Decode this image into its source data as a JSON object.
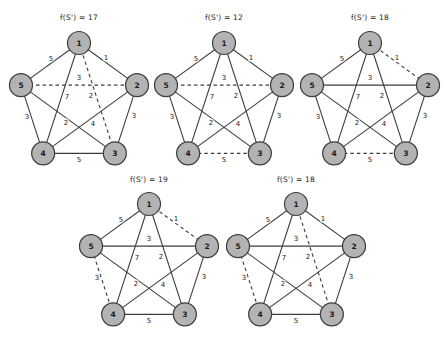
{
  "figure": {
    "node_labels": [
      "1",
      "2",
      "3",
      "4",
      "5"
    ],
    "edges": [
      {
        "from": "1",
        "to": "2",
        "weight": "1",
        "lx": 27,
        "ly": -44
      },
      {
        "from": "2",
        "to": "3",
        "weight": "3",
        "lx": 55,
        "ly": 14
      },
      {
        "from": "3",
        "to": "4",
        "weight": "5",
        "lx": 0,
        "ly": 58
      },
      {
        "from": "4",
        "to": "5",
        "weight": "3",
        "lx": -52,
        "ly": 15
      },
      {
        "from": "5",
        "to": "1",
        "weight": "5",
        "lx": -28,
        "ly": -43
      },
      {
        "from": "1",
        "to": "3",
        "weight": "2",
        "lx": 12,
        "ly": -6
      },
      {
        "from": "1",
        "to": "4",
        "weight": "7",
        "lx": -12,
        "ly": -5
      },
      {
        "from": "2",
        "to": "4",
        "weight": "4",
        "lx": 14,
        "ly": 22
      },
      {
        "from": "2",
        "to": "5",
        "weight": "3",
        "lx": 0,
        "ly": -24
      },
      {
        "from": "3",
        "to": "5",
        "weight": "2",
        "lx": -13,
        "ly": 21
      }
    ],
    "graphs": [
      {
        "title": "f(S') = 17",
        "cx": 79,
        "cy": 104,
        "dashed": [
          "2-5",
          "1-3"
        ]
      },
      {
        "title": "f(S') = 12",
        "cx": 224,
        "cy": 104,
        "dashed": [
          "2-5",
          "3-4"
        ]
      },
      {
        "title": "f(S') = 18",
        "cx": 370,
        "cy": 104,
        "dashed": [
          "1-2",
          "3-4"
        ]
      },
      {
        "title": "f(S') = 19",
        "cx": 149,
        "cy": 265,
        "dashed": [
          "1-2",
          "4-5"
        ]
      },
      {
        "title": "f(S') = 18",
        "cx": 296,
        "cy": 265,
        "dashed": [
          "1-3",
          "4-5"
        ]
      }
    ],
    "geometry": {
      "pentagon_radius": 61,
      "node_radius": 11.5,
      "node_angle_start_deg": -90,
      "node_angle_step_deg": 72
    },
    "style": {
      "background": "#ffffff",
      "edge_color": "#3d3d3d",
      "edge_width": 1.1,
      "dash_pattern": "3.5 3",
      "node_fill": "#b3b3b3",
      "node_stroke": "#3d3d3d",
      "node_stroke_width": 1.2,
      "node_text_color": "#1a1a1a",
      "weight_text_color": "#222222",
      "title_text_color": "#222222"
    }
  }
}
